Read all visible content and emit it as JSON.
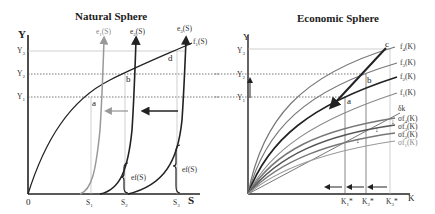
{
  "natural_sphere": {
    "title": "Natural Sphere",
    "y_axis_label": "Y",
    "x_axis_label": "S",
    "origin_label": "0",
    "y_ticks": [
      "Y3",
      "Y2",
      "Y1"
    ],
    "x_ticks": [
      "S1",
      "S2",
      "S3"
    ],
    "curve_labels": {
      "f1": "f1(S)",
      "e1": "e1(S)",
      "e2": "e2(S)",
      "e3": "e3(S)"
    },
    "points": [
      "a",
      "b",
      "d"
    ],
    "brace_labels": [
      "ef(S)",
      "ef(S)"
    ]
  },
  "economic_sphere": {
    "title": "Economic Sphere",
    "y_axis_label": "Y",
    "x_axis_label": "K",
    "y_ticks": [
      "Y3",
      "Y2",
      "Y1"
    ],
    "x_ticks": [
      "K1*",
      "K2*",
      "K3*"
    ],
    "curve_labels": {
      "f4": "f4(K)",
      "f3": "f3(K)",
      "f2": "f2(K)",
      "f1": "f1(K)",
      "delta": "δk",
      "sf4": "σf4(K)",
      "sf3": "σf3(K)",
      "sf2": "σf2(K)",
      "sf1": "σf1(K)"
    },
    "points": [
      "a",
      "b",
      "c"
    ]
  },
  "colors": {
    "dark": "#222222",
    "mid": "#555555",
    "light": "#999999",
    "guide": "#bbbbbb"
  }
}
